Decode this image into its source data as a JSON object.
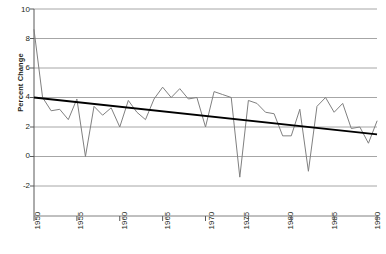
{
  "chart_data": {
    "type": "line",
    "title": "",
    "xlabel": "",
    "ylabel": "Percent Change",
    "xlim": [
      1950,
      1990
    ],
    "ylim": [
      -2,
      10
    ],
    "yticks": [
      10,
      8,
      6,
      4,
      2,
      0,
      -2
    ],
    "xticks": [
      1950,
      1955,
      1960,
      1965,
      1970,
      1975,
      1980,
      1985,
      1990
    ],
    "grid": "horizontal",
    "legend": "none",
    "series": [
      {
        "name": "Percent Change",
        "color": "#808080",
        "x": [
          1950,
          1951,
          1952,
          1953,
          1954,
          1955,
          1956,
          1957,
          1958,
          1959,
          1960,
          1961,
          1962,
          1963,
          1964,
          1965,
          1966,
          1967,
          1968,
          1969,
          1970,
          1971,
          1972,
          1973,
          1974,
          1975,
          1976,
          1977,
          1978,
          1979,
          1980,
          1981,
          1982,
          1983,
          1984,
          1985,
          1986,
          1987,
          1988,
          1989,
          1990
        ],
        "values": [
          8.6,
          4.0,
          3.1,
          3.2,
          2.5,
          3.9,
          0.0,
          3.4,
          2.8,
          3.3,
          2.0,
          3.8,
          3.0,
          2.5,
          3.9,
          4.7,
          4.0,
          4.6,
          3.9,
          4.0,
          2.0,
          4.4,
          4.2,
          4.0,
          -1.4,
          3.8,
          3.6,
          3.0,
          2.9,
          1.4,
          1.4,
          3.2,
          -1.0,
          3.4,
          4.0,
          3.0,
          3.6,
          1.9,
          2.0,
          0.9,
          2.4
        ],
        "style": "solid",
        "width": 1
      },
      {
        "name": "Linear trend",
        "color": "#000000",
        "x": [
          1950,
          1990
        ],
        "values": [
          4.0,
          1.5
        ],
        "style": "solid",
        "width": 2
      }
    ]
  },
  "axes": {
    "y_axis_title": "Percent Change",
    "y_tick_labels": [
      "10",
      "8",
      "6",
      "4",
      "2",
      "0",
      "-2"
    ],
    "x_tick_labels": [
      "1950",
      "1955",
      "1960",
      "1965",
      "1970",
      "1975",
      "1980",
      "1985",
      "1990"
    ]
  },
  "colors": {
    "series": "#808080",
    "trend": "#000000",
    "grid": "#a6a6a6",
    "axis": "#595959",
    "text": "#231f20",
    "background": "#ffffff"
  }
}
